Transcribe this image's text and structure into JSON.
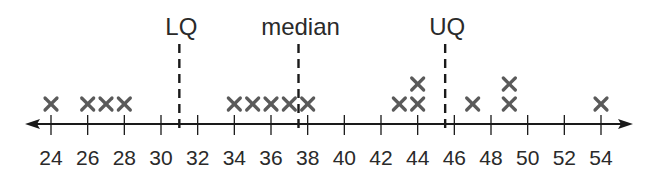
{
  "chart_data": {
    "type": "dot",
    "title": "",
    "xlabel": "",
    "ylabel": "",
    "xlim": [
      24,
      54
    ],
    "ticks": [
      24,
      26,
      28,
      30,
      32,
      34,
      36,
      38,
      40,
      42,
      44,
      46,
      48,
      50,
      52,
      54
    ],
    "tick_labels": [
      "24",
      "26",
      "28",
      "30",
      "32",
      "34",
      "36",
      "38",
      "40",
      "42",
      "44",
      "46",
      "48",
      "50",
      "52",
      "54"
    ],
    "marker_symbol": "×",
    "values": [
      24,
      26,
      27,
      28,
      34,
      35,
      36,
      37,
      38,
      43,
      44,
      44,
      47,
      49,
      49,
      54
    ],
    "reference_lines": [
      {
        "label": "LQ",
        "value": 31
      },
      {
        "label": "median",
        "value": 37.5
      },
      {
        "label": "UQ",
        "value": 45.5
      }
    ],
    "grid": false,
    "axis_arrows": "both"
  },
  "colors": {
    "axis": "#1a1a1a",
    "marker": "#5a5a5a",
    "text": "#2a2a2a"
  }
}
